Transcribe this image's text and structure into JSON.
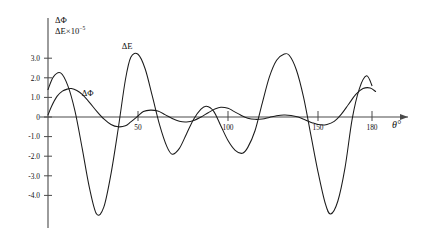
{
  "chart_data": {
    "type": "line",
    "title": "",
    "subtitle": "",
    "xlabel": "θ°",
    "ylabel_line1": "ΔΦ",
    "ylabel_line2_symbol": "ΔE",
    "ylabel_line2_factor": "×10",
    "ylabel_line2_exponent": "−5",
    "xlim": [
      0,
      190
    ],
    "ylim": [
      -5.2,
      3.6
    ],
    "grid": false,
    "legend_position": "inline-annotations",
    "xticks": [
      50,
      100,
      150,
      180
    ],
    "xticklabels": [
      "50",
      "100",
      "150",
      "180"
    ],
    "yticks": [
      3.0,
      2.0,
      1.0,
      0,
      -1.0,
      -2.0,
      -3.0,
      -4.0
    ],
    "yticklabels": [
      "3.0",
      "2.0",
      "1.0",
      "0",
      "-1.0",
      "-2.0",
      "-3.0",
      "-4.0"
    ],
    "annotations": [
      {
        "text": "ΔE",
        "x": 44,
        "y": 3.45
      },
      {
        "text": "ΔΦ",
        "x": 22,
        "y": 1.05
      }
    ],
    "series": [
      {
        "name": "ΔE",
        "label": "ΔE",
        "color": "#1b1b1b",
        "x": [
          0,
          3,
          7,
          11,
          15,
          19,
          23,
          27,
          31,
          35,
          39,
          43,
          46,
          50,
          54,
          58,
          62,
          66,
          69,
          73,
          77,
          81,
          85,
          88,
          92,
          96,
          100,
          104,
          108,
          111,
          115,
          119,
          123,
          127,
          131,
          134,
          138,
          142,
          146,
          150,
          154,
          157,
          161,
          165,
          169,
          173,
          177,
          180
        ],
        "y": [
          1.4,
          2.05,
          2.25,
          1.6,
          0.3,
          -1.6,
          -3.6,
          -4.95,
          -4.6,
          -2.9,
          -0.6,
          1.9,
          3.05,
          3.2,
          2.45,
          1.05,
          -0.4,
          -1.5,
          -1.9,
          -1.6,
          -0.85,
          -0.1,
          0.4,
          0.55,
          0.3,
          -0.45,
          -1.2,
          -1.7,
          -1.85,
          -1.55,
          -0.7,
          0.7,
          2.05,
          2.9,
          3.2,
          3.15,
          2.4,
          1.0,
          -0.9,
          -2.8,
          -4.4,
          -4.95,
          -4.3,
          -2.6,
          -0.1,
          1.45,
          2.1,
          1.6
        ]
      },
      {
        "name": "ΔΦ",
        "label": "ΔΦ",
        "color": "#1b1b1b",
        "x": [
          0,
          2,
          5,
          8,
          11,
          13,
          16,
          19,
          23,
          27,
          31,
          35,
          39,
          43,
          46,
          50,
          53,
          57,
          61,
          65,
          69,
          73,
          77,
          81,
          85,
          89,
          93,
          96,
          100,
          103,
          107,
          111,
          115,
          119,
          123,
          127,
          131,
          135,
          139,
          143,
          147,
          151,
          155,
          159,
          163,
          167,
          171,
          175,
          179,
          182
        ],
        "y": [
          0.1,
          0.55,
          1.05,
          1.32,
          1.43,
          1.45,
          1.35,
          1.15,
          0.75,
          0.3,
          -0.1,
          -0.38,
          -0.5,
          -0.45,
          -0.25,
          0.05,
          0.28,
          0.35,
          0.3,
          0.12,
          -0.08,
          -0.22,
          -0.25,
          -0.18,
          0.0,
          0.22,
          0.42,
          0.5,
          0.45,
          0.3,
          0.1,
          -0.06,
          -0.12,
          -0.1,
          -0.02,
          0.06,
          0.1,
          0.08,
          0.0,
          -0.15,
          -0.3,
          -0.4,
          -0.38,
          -0.22,
          0.15,
          0.65,
          1.15,
          1.45,
          1.48,
          1.3
        ]
      }
    ]
  }
}
